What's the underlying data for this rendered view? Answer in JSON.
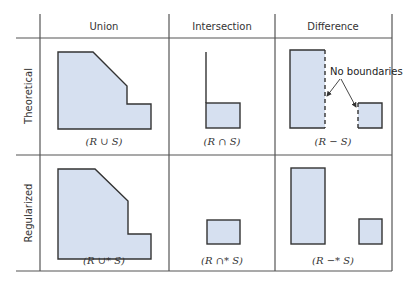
{
  "figure": {
    "columns": [
      "Union",
      "Intersection",
      "Difference"
    ],
    "rows": [
      "Theoretical",
      "Regularized"
    ],
    "captions": {
      "theoretical": [
        "(R ∪ S)",
        "(R ∩ S)",
        "(R − S)"
      ],
      "regularized": [
        "(R ∪* S)",
        "(R ∩* S)",
        "(R −* S)"
      ]
    },
    "annotation": "No boundaries",
    "colors": {
      "shape_fill": "#d6e0f0",
      "outline": "#333333",
      "grid": "#555555"
    }
  }
}
